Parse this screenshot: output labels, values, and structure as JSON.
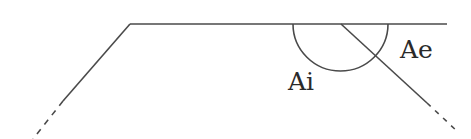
{
  "diagram": {
    "labels": {
      "interior_angle": "Ai",
      "exterior_angle": "Ae"
    },
    "colors": {
      "stroke": "#4a4a4a",
      "text": "#2a2a2a",
      "background": "#ffffff"
    }
  }
}
